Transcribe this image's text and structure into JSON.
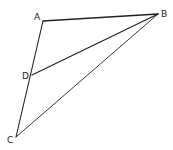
{
  "figure": {
    "points": [
      {
        "id": "A",
        "label": "A",
        "x": 43,
        "y": 21,
        "lx": 34,
        "ly": 20
      },
      {
        "id": "B",
        "label": "B",
        "x": 158,
        "y": 14,
        "lx": 161,
        "ly": 17
      },
      {
        "id": "D",
        "label": "D",
        "x": 32,
        "y": 75,
        "lx": 22,
        "ly": 79
      },
      {
        "id": "C",
        "label": "C",
        "x": 16,
        "y": 137,
        "lx": 7,
        "ly": 143
      }
    ],
    "segments": [
      {
        "from": "A",
        "to": "B",
        "weight": 1.3
      },
      {
        "from": "A",
        "to": "C",
        "weight": 1.1
      },
      {
        "from": "D",
        "to": "B",
        "weight": 1.2
      },
      {
        "from": "C",
        "to": "B",
        "weight": 0.9
      }
    ],
    "stroke_color": "#222222",
    "background": "#ffffff"
  }
}
